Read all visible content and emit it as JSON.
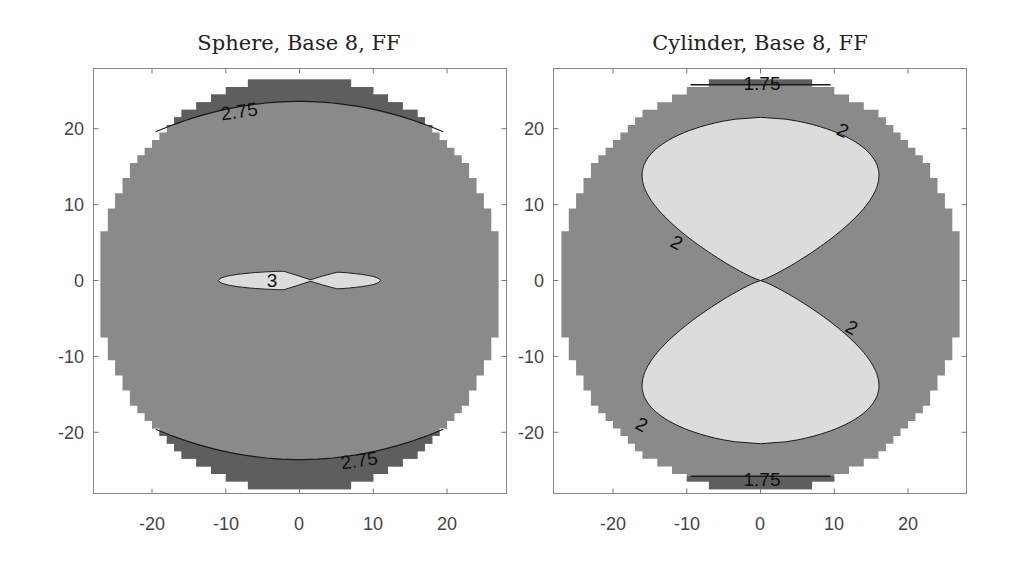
{
  "colors": {
    "dark": "#5e5e5e",
    "medium": "#8a8a8a",
    "light": "#dcdcdc",
    "line": "#1a1a1a",
    "axis": "#888888"
  },
  "chart_data": [
    {
      "type": "contour",
      "title": "Sphere, Base 8, FF",
      "xlim": [
        -28,
        28
      ],
      "ylim": [
        -28,
        28
      ],
      "xticks": [
        -20,
        -10,
        0,
        10,
        20
      ],
      "yticks": [
        20,
        10,
        0,
        -10,
        -20
      ],
      "xtick_labels": [
        "-20",
        "-10",
        "0",
        "10",
        "20"
      ],
      "ytick_labels": [
        "20",
        "10",
        "0",
        "-10",
        "-20"
      ],
      "domain": "disk radius ~27.5",
      "levels": [
        2.75,
        3
      ],
      "level_labels": [
        "2.75",
        "2.75",
        "3"
      ],
      "regions": [
        {
          "value_range": ">2.75 near top/bottom caps (|y|>~23)",
          "shade": "dark"
        },
        {
          "value_range": "2.75-3 (bulk)",
          "shade": "medium"
        },
        {
          "value_range": ">3 (figure-eight lobes along x-axis, x from -11 to 11)",
          "shade": "light"
        }
      ]
    },
    {
      "type": "contour",
      "title": "Cylinder, Base 8, FF",
      "xlim": [
        -28,
        28
      ],
      "ylim": [
        -28,
        28
      ],
      "xticks": [
        -20,
        -10,
        0,
        10,
        20
      ],
      "yticks": [
        20,
        10,
        0,
        -10,
        -20
      ],
      "xtick_labels": [
        "-20",
        "-10",
        "0",
        "10",
        "20"
      ],
      "ytick_labels": [
        "20",
        "10",
        "0",
        "-10",
        "-20"
      ],
      "domain": "disk radius ~27.5",
      "levels": [
        1.75,
        2
      ],
      "level_labels": [
        "1.75",
        "1.75",
        "2",
        "2",
        "2",
        "2"
      ],
      "regions": [
        {
          "value_range": "<1.75 thin caps at |y|>~26",
          "shade": "dark"
        },
        {
          "value_range": "1.75-2",
          "shade": "medium"
        },
        {
          "value_range": ">2 (hourglass lobes, y from 0 to ±21.5, x ±20)",
          "shade": "light"
        }
      ]
    }
  ]
}
